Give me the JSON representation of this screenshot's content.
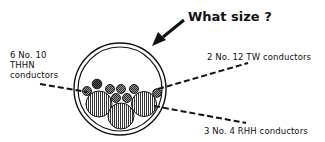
{
  "diagram": {
    "question": "What size ?",
    "labels": {
      "thhn": [
        "6 No. 10",
        "THHN",
        "conductors"
      ],
      "tw": "2 No. 12 TW conductors",
      "rhh": "3 No. 4 RHH conductors"
    },
    "colors": {
      "ink": "#111111",
      "background": "#ffffff",
      "fill_light": "#bdbdbd",
      "fill_dark": "#6e6e6e"
    }
  }
}
